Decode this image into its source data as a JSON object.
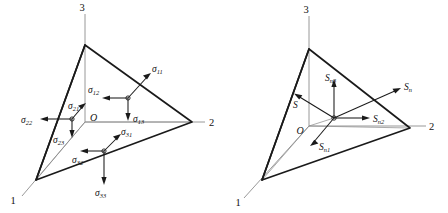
{
  "figure": {
    "background_color": "#ffffff",
    "ink_color": "#1a1a1a",
    "hidden_edge_color": "#8d8d8d"
  },
  "left_diagram": {
    "name": "stress-component-tetrahedron",
    "vertices": {
      "axis1_label": "1",
      "axis2_label": "2",
      "axis3_label": "3",
      "origin_label": "O"
    },
    "stress_groups": [
      {
        "face": "face-normal-1",
        "components": [
          {
            "symbol": "σ",
            "sub": "11",
            "direction": "up-right"
          },
          {
            "symbol": "σ",
            "sub": "12",
            "direction": "left"
          },
          {
            "symbol": "σ",
            "sub": "13",
            "direction": "down"
          }
        ]
      },
      {
        "face": "face-normal-2",
        "components": [
          {
            "symbol": "σ",
            "sub": "22",
            "direction": "left"
          },
          {
            "symbol": "σ",
            "sub": "21",
            "direction": "up-right"
          },
          {
            "symbol": "σ",
            "sub": "23",
            "direction": "down"
          }
        ]
      },
      {
        "face": "face-normal-3",
        "components": [
          {
            "symbol": "σ",
            "sub": "31",
            "direction": "up-right"
          },
          {
            "symbol": "σ",
            "sub": "32",
            "direction": "left"
          },
          {
            "symbol": "σ",
            "sub": "33",
            "direction": "down"
          }
        ]
      }
    ]
  },
  "right_diagram": {
    "name": "traction-vector-tetrahedron",
    "vertices": {
      "axis1_label": "1",
      "axis2_label": "2",
      "axis3_label": "3",
      "origin_label": "O"
    },
    "vectors": [
      {
        "symbol": "S",
        "sub": "n",
        "direction": "up-right",
        "role": "resultant-traction"
      },
      {
        "symbol": "S",
        "sub": "n3",
        "direction": "up",
        "role": "component-3"
      },
      {
        "symbol": "S",
        "sub": "n2",
        "direction": "right",
        "role": "component-2"
      },
      {
        "symbol": "S",
        "sub": "n1",
        "direction": "down-left",
        "role": "component-1"
      },
      {
        "symbol": "S",
        "sub": "",
        "direction": "up-left",
        "role": "shear-traction"
      }
    ]
  }
}
